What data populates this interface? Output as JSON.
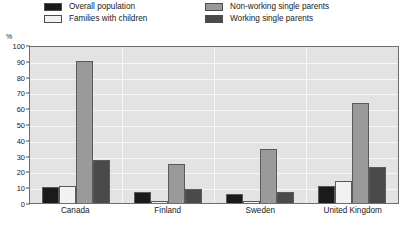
{
  "legend": {
    "items": [
      {
        "label": "Overall population",
        "color": "#1a1a1a",
        "column": 1,
        "row": 1
      },
      {
        "label": "Families with children",
        "color": "#f2f2f2",
        "column": 1,
        "row": 2
      },
      {
        "label": "Non-working single parents",
        "color": "#9a9a9a",
        "column": 2,
        "row": 1
      },
      {
        "label": "Working single parents",
        "color": "#4a4a4a",
        "column": 2,
        "row": 2
      }
    ]
  },
  "axis": {
    "unit_label": "%",
    "y_ticks": [
      "100",
      "90",
      "80",
      "70",
      "60",
      "50",
      "40",
      "30",
      "20",
      "10",
      "0"
    ]
  },
  "chart_data": {
    "type": "bar",
    "title": "",
    "xlabel": "",
    "ylabel": "%",
    "ylim": [
      0,
      100
    ],
    "grid": true,
    "legend_position": "top",
    "categories": [
      "Canada",
      "Finland",
      "Sweden",
      "United Kingdom"
    ],
    "series": [
      {
        "name": "Overall population",
        "color": "#1a1a1a",
        "values": [
          10,
          7,
          6,
          11
        ]
      },
      {
        "name": "Families with children",
        "color": "#f2f2f2",
        "values": [
          11,
          1.5,
          1.5,
          14
        ]
      },
      {
        "name": "Non-working single parents",
        "color": "#9a9a9a",
        "values": [
          90,
          25,
          34,
          63
        ]
      },
      {
        "name": "Working single parents",
        "color": "#4a4a4a",
        "values": [
          27,
          9,
          7,
          23
        ]
      }
    ]
  }
}
